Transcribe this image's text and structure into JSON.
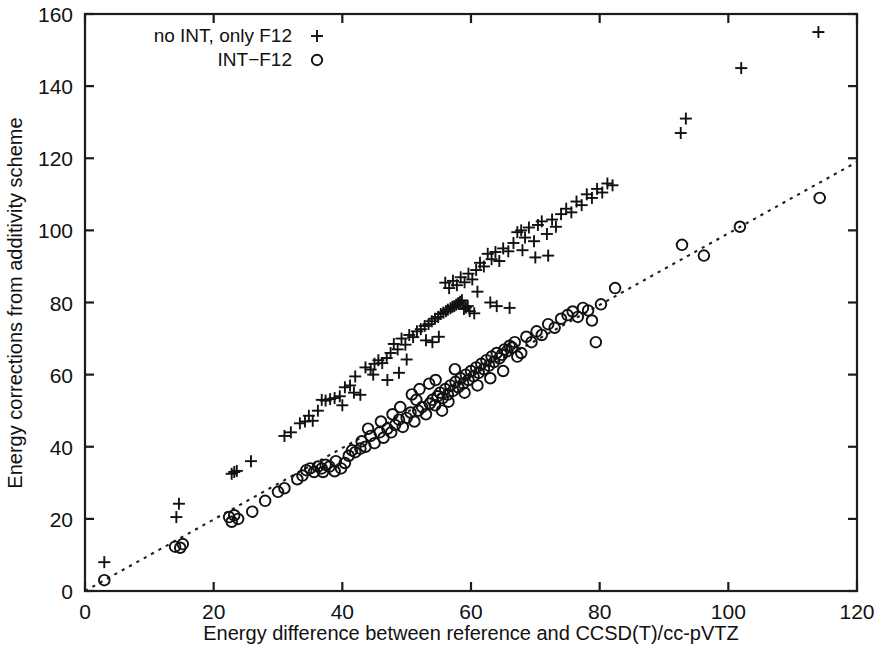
{
  "figure": {
    "background_color": "#ffffff",
    "foreground_color": "#111111",
    "width": 875,
    "height": 648
  },
  "chart_data": {
    "type": "scatter",
    "title": "",
    "subtitle": "",
    "xlabel": "Energy difference between reference and CCSD(T)/cc-pVTZ",
    "ylabel": "Energy corrections from additivity scheme",
    "xlim": [
      0,
      120
    ],
    "ylim": [
      0,
      160
    ],
    "xticks": [
      0,
      20,
      40,
      60,
      80,
      100,
      120
    ],
    "yticks": [
      0,
      20,
      40,
      60,
      80,
      100,
      120,
      140,
      160
    ],
    "xtick_labels": [
      "0",
      "20",
      "40",
      "60",
      "80",
      "100",
      "120"
    ],
    "ytick_labels": [
      "0",
      "20",
      "40",
      "60",
      "80",
      "100",
      "120",
      "140",
      "160"
    ],
    "grid": false,
    "legend_position": "top-left",
    "annotations": [
      {
        "name": "identity-reference-line",
        "kind": "line",
        "style": "dotted",
        "x0": 0,
        "y0": 0,
        "x1": 120,
        "y1": 119,
        "description": "dotted diagonal reference line of unit slope"
      }
    ],
    "series": [
      {
        "name": "no INT, only F12",
        "marker": "plus",
        "color": "#111111",
        "points": [
          [
            3.0,
            8.0
          ],
          [
            14.2,
            20.5
          ],
          [
            14.6,
            24.2
          ],
          [
            22.8,
            32.5
          ],
          [
            23.2,
            33.0
          ],
          [
            23.6,
            33.3
          ],
          [
            25.8,
            36.0
          ],
          [
            33.4,
            46.5
          ],
          [
            34.2,
            47.0
          ],
          [
            34.8,
            48.6
          ],
          [
            35.4,
            47.2
          ],
          [
            36.2,
            50.0
          ],
          [
            36.8,
            53.0
          ],
          [
            37.4,
            52.8
          ],
          [
            38.1,
            53.2
          ],
          [
            38.8,
            53.5
          ],
          [
            39.6,
            54.0
          ],
          [
            40.4,
            56.5
          ],
          [
            41.2,
            57.0
          ],
          [
            42.0,
            59.5
          ],
          [
            43.6,
            62.0
          ],
          [
            44.4,
            61.4
          ],
          [
            45.0,
            63.0
          ],
          [
            45.6,
            64.0
          ],
          [
            46.2,
            63.2
          ],
          [
            46.9,
            64.6
          ],
          [
            47.5,
            66.0
          ],
          [
            48.0,
            68.5
          ],
          [
            48.6,
            67.0
          ],
          [
            49.2,
            70.0
          ],
          [
            49.8,
            68.3
          ],
          [
            50.4,
            71.0
          ],
          [
            51.0,
            70.4
          ],
          [
            51.6,
            72.0
          ],
          [
            52.2,
            72.6
          ],
          [
            52.8,
            73.5
          ],
          [
            53.4,
            74.0
          ],
          [
            53.9,
            74.8
          ],
          [
            54.4,
            75.5
          ],
          [
            54.9,
            76.0
          ],
          [
            55.3,
            76.8
          ],
          [
            55.7,
            77.2
          ],
          [
            56.1,
            77.6
          ],
          [
            56.4,
            78.0
          ],
          [
            56.8,
            78.4
          ],
          [
            57.1,
            78.8
          ],
          [
            57.4,
            79.0
          ],
          [
            57.7,
            79.4
          ],
          [
            58.0,
            79.8
          ],
          [
            58.3,
            80.2
          ],
          [
            58.6,
            80.6
          ],
          [
            58.9,
            78.2
          ],
          [
            59.2,
            78.6
          ],
          [
            59.5,
            79.0
          ],
          [
            59.8,
            77.6
          ],
          [
            56.0,
            85.5
          ],
          [
            56.6,
            84.0
          ],
          [
            57.2,
            86.0
          ],
          [
            57.8,
            84.8
          ],
          [
            58.4,
            87.0
          ],
          [
            59.0,
            85.6
          ],
          [
            59.6,
            88.0
          ],
          [
            60.2,
            86.4
          ],
          [
            60.8,
            89.0
          ],
          [
            61.4,
            91.0
          ],
          [
            62.0,
            90.0
          ],
          [
            62.6,
            93.5
          ],
          [
            63.2,
            92.0
          ],
          [
            63.8,
            94.0
          ],
          [
            64.4,
            91.5
          ],
          [
            65.0,
            95.0
          ],
          [
            65.8,
            94.2
          ],
          [
            66.6,
            96.5
          ],
          [
            67.2,
            99.5
          ],
          [
            67.8,
            100.0
          ],
          [
            68.4,
            98.0
          ],
          [
            69.0,
            100.8
          ],
          [
            69.8,
            97.0
          ],
          [
            70.4,
            101.5
          ],
          [
            71.0,
            102.5
          ],
          [
            71.8,
            99.0
          ],
          [
            72.6,
            103.0
          ],
          [
            73.2,
            101.0
          ],
          [
            74.0,
            104.5
          ],
          [
            74.8,
            106.0
          ],
          [
            75.6,
            105.0
          ],
          [
            76.4,
            108.0
          ],
          [
            77.2,
            107.0
          ],
          [
            78.0,
            110.0
          ],
          [
            78.8,
            109.0
          ],
          [
            79.6,
            111.5
          ],
          [
            80.4,
            110.5
          ],
          [
            81.2,
            113.0
          ],
          [
            82.0,
            112.5
          ],
          [
            44.8,
            60.0
          ],
          [
            50.0,
            64.2
          ],
          [
            53.0,
            69.5
          ],
          [
            60.5,
            77.0
          ],
          [
            63.0,
            80.0
          ],
          [
            64.0,
            79.0
          ],
          [
            66.0,
            78.5
          ],
          [
            68.0,
            94.5
          ],
          [
            70.0,
            92.5
          ],
          [
            72.0,
            93.0
          ],
          [
            31.0,
            43.0
          ],
          [
            32.0,
            44.0
          ],
          [
            40.0,
            51.5
          ],
          [
            41.8,
            55.0
          ],
          [
            42.8,
            54.4
          ],
          [
            47.0,
            58.5
          ],
          [
            48.8,
            60.5
          ],
          [
            54.0,
            69.0
          ],
          [
            55.0,
            70.5
          ],
          [
            61.0,
            83.0
          ],
          [
            92.6,
            127.0
          ],
          [
            93.4,
            131.0
          ],
          [
            102.0,
            145.0
          ],
          [
            114.0,
            155.0
          ]
        ]
      },
      {
        "name": "INT-F12",
        "marker": "circle",
        "color": "#111111",
        "points": [
          [
            3.0,
            3.0
          ],
          [
            14.0,
            12.3
          ],
          [
            14.8,
            12.0
          ],
          [
            15.2,
            13.0
          ],
          [
            22.4,
            20.5
          ],
          [
            22.8,
            19.2
          ],
          [
            23.2,
            21.0
          ],
          [
            23.8,
            20.0
          ],
          [
            26.0,
            22.0
          ],
          [
            28.0,
            25.0
          ],
          [
            30.0,
            27.5
          ],
          [
            31.0,
            28.5
          ],
          [
            33.0,
            31.0
          ],
          [
            33.8,
            32.0
          ],
          [
            34.4,
            33.5
          ],
          [
            35.0,
            34.0
          ],
          [
            35.6,
            33.0
          ],
          [
            36.2,
            34.5
          ],
          [
            36.8,
            34.0
          ],
          [
            37.4,
            35.0
          ],
          [
            38.0,
            34.5
          ],
          [
            38.8,
            33.2
          ],
          [
            39.8,
            34.0
          ],
          [
            41.0,
            37.5
          ],
          [
            42.0,
            38.5
          ],
          [
            42.8,
            39.5
          ],
          [
            43.6,
            40.0
          ],
          [
            44.4,
            43.0
          ],
          [
            45.0,
            41.0
          ],
          [
            45.8,
            44.0
          ],
          [
            46.4,
            42.5
          ],
          [
            47.0,
            45.0
          ],
          [
            47.6,
            44.0
          ],
          [
            48.2,
            46.0
          ],
          [
            48.8,
            47.5
          ],
          [
            49.4,
            45.5
          ],
          [
            50.0,
            48.0
          ],
          [
            50.6,
            49.5
          ],
          [
            51.2,
            47.0
          ],
          [
            51.8,
            50.0
          ],
          [
            52.4,
            51.0
          ],
          [
            53.0,
            49.0
          ],
          [
            53.6,
            52.0
          ],
          [
            54.0,
            53.0
          ],
          [
            54.4,
            51.5
          ],
          [
            54.8,
            54.0
          ],
          [
            55.2,
            55.0
          ],
          [
            55.6,
            53.5
          ],
          [
            56.0,
            56.0
          ],
          [
            56.4,
            54.5
          ],
          [
            56.8,
            57.0
          ],
          [
            57.2,
            55.5
          ],
          [
            57.6,
            58.0
          ],
          [
            58.0,
            56.5
          ],
          [
            58.4,
            59.0
          ],
          [
            58.8,
            57.5
          ],
          [
            59.2,
            60.0
          ],
          [
            59.6,
            58.5
          ],
          [
            60.0,
            61.0
          ],
          [
            60.4,
            59.5
          ],
          [
            60.8,
            62.0
          ],
          [
            61.2,
            60.5
          ],
          [
            61.6,
            63.0
          ],
          [
            62.0,
            61.5
          ],
          [
            62.4,
            64.0
          ],
          [
            62.8,
            62.5
          ],
          [
            63.2,
            65.0
          ],
          [
            63.6,
            63.5
          ],
          [
            64.0,
            66.0
          ],
          [
            64.4,
            64.5
          ],
          [
            64.8,
            65.5
          ],
          [
            65.2,
            67.0
          ],
          [
            65.6,
            66.5
          ],
          [
            66.0,
            68.0
          ],
          [
            66.4,
            67.5
          ],
          [
            66.8,
            69.0
          ],
          [
            67.2,
            65.0
          ],
          [
            53.5,
            57.5
          ],
          [
            54.5,
            58.5
          ],
          [
            55.5,
            50.0
          ],
          [
            56.5,
            52.5
          ],
          [
            57.5,
            61.5
          ],
          [
            50.8,
            54.5
          ],
          [
            52.0,
            56.0
          ],
          [
            49.0,
            51.0
          ],
          [
            47.8,
            49.0
          ],
          [
            44.0,
            45.0
          ],
          [
            46.0,
            47.0
          ],
          [
            51.5,
            53.0
          ],
          [
            59.0,
            55.0
          ],
          [
            61.0,
            57.0
          ],
          [
            63.0,
            59.0
          ],
          [
            65.0,
            61.0
          ],
          [
            67.8,
            66.0
          ],
          [
            68.6,
            70.5
          ],
          [
            69.4,
            69.0
          ],
          [
            70.2,
            72.0
          ],
          [
            71.0,
            71.0
          ],
          [
            72.0,
            74.0
          ],
          [
            73.0,
            73.0
          ],
          [
            74.0,
            75.5
          ],
          [
            75.0,
            76.5
          ],
          [
            75.8,
            77.5
          ],
          [
            76.6,
            76.0
          ],
          [
            77.4,
            78.5
          ],
          [
            78.2,
            77.8
          ],
          [
            78.8,
            75.0
          ],
          [
            79.4,
            69.0
          ],
          [
            80.2,
            79.5
          ],
          [
            82.4,
            84.0
          ],
          [
            92.8,
            96.0
          ],
          [
            96.2,
            93.0
          ],
          [
            101.8,
            101.0
          ],
          [
            114.2,
            109.0
          ],
          [
            40.4,
            35.5
          ],
          [
            43.0,
            41.5
          ],
          [
            41.5,
            39.0
          ],
          [
            39.0,
            36.0
          ],
          [
            37.0,
            33.0
          ]
        ]
      }
    ]
  },
  "legend": {
    "entries": [
      {
        "label": "no INT, only F12",
        "marker": "plus"
      },
      {
        "label": "INT−F12",
        "marker": "circle"
      }
    ]
  }
}
